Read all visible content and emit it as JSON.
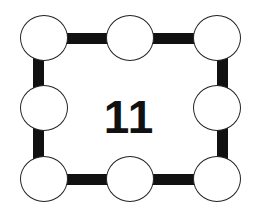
{
  "puzzle": {
    "center_value": "11",
    "nodes": [
      {
        "position": "top-left",
        "value": ""
      },
      {
        "position": "top-middle",
        "value": ""
      },
      {
        "position": "top-right",
        "value": ""
      },
      {
        "position": "middle-left",
        "value": ""
      },
      {
        "position": "middle-right",
        "value": ""
      },
      {
        "position": "bottom-left",
        "value": ""
      },
      {
        "position": "bottom-middle",
        "value": ""
      },
      {
        "position": "bottom-right",
        "value": ""
      }
    ]
  },
  "colors": {
    "frame": "#111111",
    "node_fill": "#ffffff",
    "node_border": "#222222",
    "background": "#ffffff"
  }
}
